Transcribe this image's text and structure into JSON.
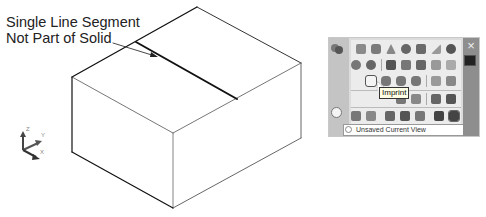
{
  "callout": {
    "line1": "Single Line Segment",
    "line2": "Not Part of Solid"
  },
  "drawing": {
    "box_vertices": {
      "top_back": [
        197,
        7
      ],
      "top_left": [
        72,
        77
      ],
      "top_right": [
        301,
        63
      ],
      "top_front": [
        173,
        133
      ],
      "bottom_left": [
        72,
        152
      ],
      "bottom_right": [
        301,
        138
      ],
      "bottom_front": [
        173,
        208
      ]
    },
    "segment": {
      "from": [
        136,
        42
      ],
      "to": [
        237,
        99
      ]
    },
    "leader_arrow": {
      "from": [
        113,
        43
      ],
      "to": [
        157,
        57
      ]
    },
    "ucs": {
      "z_label": "Z",
      "y_label": "Y",
      "x_label": "X"
    }
  },
  "panel": {
    "close_glyph": "×",
    "tooltip": "Imprint",
    "view_select": {
      "value": "Unsaved Current View",
      "arrow": "▾"
    },
    "colors": {
      "panel_bg": "#dcdcdc",
      "title_bar": "#8e8e8e",
      "tooltip_bg": "#ffffe6"
    },
    "rows": [
      {
        "icons": [
          "box-icon",
          "cylinder-icon",
          "cone-icon",
          "sphere-icon",
          "pyramid-icon",
          "wedge-icon",
          "torus-icon"
        ]
      },
      {
        "icons": [
          "polysolid-icon",
          "extrude-icon",
          "presspull-icon",
          "sweep-icon",
          "revolve-icon",
          "loft-icon",
          "helix-icon"
        ]
      },
      {
        "icons": [
          "imprint-icon",
          "union-icon",
          "subtract-icon",
          "intersect-icon",
          "slice-icon",
          "interfere-icon"
        ]
      },
      {
        "icons": [
          "section-plane-icon",
          "extract-edges-icon",
          "shell-icon",
          "check-icon"
        ]
      },
      {
        "icons": [
          "orbit-icon",
          "zoom-icon",
          "pan-icon",
          "walk-icon",
          "fly-icon",
          "camera-icon",
          "view-icon",
          "visual-style-icon"
        ]
      }
    ]
  }
}
